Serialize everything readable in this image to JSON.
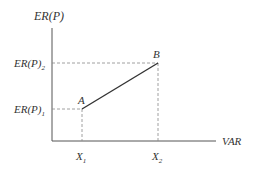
{
  "diagram": {
    "y_axis_label": "ER(P)",
    "x_axis_label": "VAR",
    "y_ticks": [
      {
        "base": "ER(P)",
        "sub": "1"
      },
      {
        "base": "ER(P)",
        "sub": "2"
      }
    ],
    "x_ticks": [
      {
        "base": "X",
        "sub": "1"
      },
      {
        "base": "X",
        "sub": "2"
      }
    ],
    "points": [
      {
        "label": "A",
        "x": "X1",
        "y": "ER(P)1"
      },
      {
        "label": "B",
        "x": "X2",
        "y": "ER(P)2"
      }
    ],
    "colors": {
      "line": "#333333",
      "axis": "#555555",
      "dashed": "#888888"
    }
  }
}
